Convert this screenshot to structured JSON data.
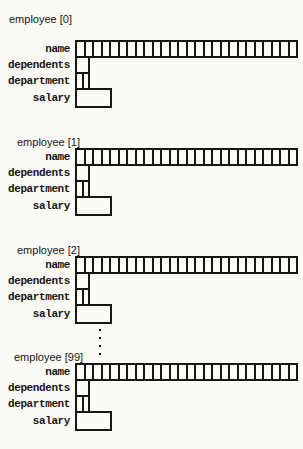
{
  "diagram": {
    "blocks": [
      {
        "label": "employee [0]"
      },
      {
        "label": "employee [1]"
      },
      {
        "label": "employee [2]"
      },
      {
        "label": "employee [99]"
      }
    ],
    "fields": {
      "name": {
        "label": "name",
        "cells": 26
      },
      "dependents": {
        "label": "dependents",
        "cells": 1
      },
      "department": {
        "label": "department",
        "cells": 2
      },
      "salary": {
        "label": "salary",
        "cells": 1
      }
    },
    "colors": {
      "line": "#161616",
      "text": "#161616",
      "background": "#fbfaf7"
    }
  }
}
